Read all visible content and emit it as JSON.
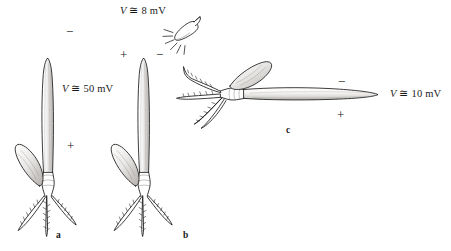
{
  "figure": {
    "background_color": "#ffffff",
    "ink_color": "#1a1a1a",
    "caption_letters": {
      "a": "a",
      "b": "b",
      "c": "c"
    }
  },
  "panels": [
    {
      "id": "a",
      "letter": "a",
      "orientation": "vertical",
      "voltage_label": "50 mV",
      "voltage_symbol": "V",
      "voltage_relation": "≅",
      "voltage_full": "V ≅ 50 mV",
      "tip_sign": "−",
      "base_sign": "+",
      "has_lamp": false
    },
    {
      "id": "b",
      "letter": "b",
      "orientation": "vertical",
      "voltage_label": "8 mV",
      "voltage_symbol": "V",
      "voltage_relation": "≅",
      "voltage_full": "V ≅ 8 mV",
      "tip_sign": "−",
      "base_sign": "+",
      "has_lamp": true,
      "lamp_name": "lamp-icon",
      "illuminated_side_sign": "−",
      "shaded_side_sign": "+"
    },
    {
      "id": "c",
      "letter": "c",
      "orientation": "horizontal",
      "voltage_label": "10 mV",
      "voltage_symbol": "V",
      "voltage_relation": "≅",
      "voltage_full": "V ≅ 10 mV",
      "upper_sign": "−",
      "lower_sign": "+",
      "has_lamp": false
    }
  ],
  "labels": {
    "v50": "50 mV",
    "v8": "8 mV",
    "v10": "10 mV",
    "vsym": "V",
    "approx": "≅",
    "minus": "−",
    "plus": "+",
    "letter_a": "a",
    "letter_b": "b",
    "letter_c": "c"
  }
}
